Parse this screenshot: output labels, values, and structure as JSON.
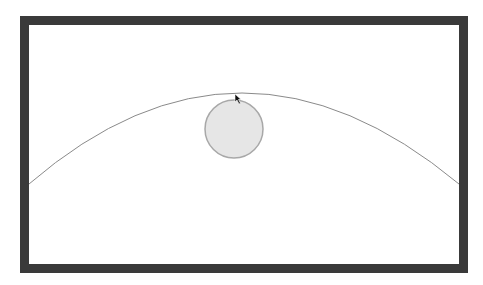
{
  "scene": {
    "frame": {
      "x": 20,
      "y": 16,
      "width": 448,
      "height": 257,
      "border_width": 9,
      "border_color": "#3a3a3a",
      "inner_color": "#ffffff"
    },
    "arc": {
      "start": [
        29,
        184
      ],
      "control": [
        240,
        2
      ],
      "end": [
        459,
        184
      ],
      "stroke": "#8a8a8a",
      "stroke_width": 1
    },
    "ball": {
      "cx": 234,
      "cy": 129,
      "r": 29,
      "fill": "#e6e6e6",
      "stroke": "#a8a8a8",
      "stroke_width": 1.5
    },
    "cursor": {
      "x": 235,
      "y": 94,
      "icon": "arrow-cursor-icon"
    }
  }
}
